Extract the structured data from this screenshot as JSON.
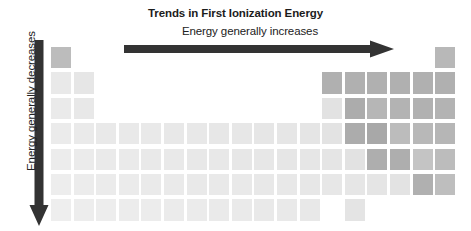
{
  "figure": {
    "title": "Trends in First Ionization Energy",
    "horizontal_label": "Energy generally increases",
    "vertical_label": "Energy generally decreases",
    "arrow_color": "#333333",
    "title_color": "#1c1c1c"
  },
  "chart_data": {
    "type": "heatmap",
    "title": "Trends in First Ionization Energy",
    "xlabel": "Energy generally increases",
    "ylabel": "Energy generally decreases",
    "subtitle": "",
    "grid": false,
    "legend": "none",
    "columns": 18,
    "rows": 7,
    "col_pitch_px": 22.6,
    "row_pitch_px": 25.4,
    "value_range": [
      0,
      1
    ],
    "color_low": "#e8e8e8",
    "color_high": "#9a9a9a",
    "cells": [
      {
        "row": 1,
        "col": 1,
        "value": 0.62,
        "color": "#bcbcbc"
      },
      {
        "row": 1,
        "col": 18,
        "value": 0.6,
        "color": "#b8b8b8"
      },
      {
        "row": 2,
        "col": 1,
        "value": 0.06,
        "color": "#e9e9e9"
      },
      {
        "row": 2,
        "col": 2,
        "value": 0.1,
        "color": "#e6e6e6"
      },
      {
        "row": 2,
        "col": 13,
        "value": 0.58,
        "color": "#b0b0b0"
      },
      {
        "row": 2,
        "col": 14,
        "value": 0.58,
        "color": "#b0b0b0"
      },
      {
        "row": 2,
        "col": 15,
        "value": 0.58,
        "color": "#b0b0b0"
      },
      {
        "row": 2,
        "col": 16,
        "value": 0.58,
        "color": "#b0b0b0"
      },
      {
        "row": 2,
        "col": 17,
        "value": 0.58,
        "color": "#b0b0b0"
      },
      {
        "row": 2,
        "col": 18,
        "value": 0.58,
        "color": "#b0b0b0"
      },
      {
        "row": 3,
        "col": 1,
        "value": 0.05,
        "color": "#eaeaea"
      },
      {
        "row": 3,
        "col": 2,
        "value": 0.08,
        "color": "#e8e8e8"
      },
      {
        "row": 3,
        "col": 13,
        "value": 0.14,
        "color": "#e2e2e2"
      },
      {
        "row": 3,
        "col": 14,
        "value": 0.62,
        "color": "#acacac"
      },
      {
        "row": 3,
        "col": 15,
        "value": 0.52,
        "color": "#b6b6b6"
      },
      {
        "row": 3,
        "col": 16,
        "value": 0.55,
        "color": "#b3b3b3"
      },
      {
        "row": 3,
        "col": 17,
        "value": 0.57,
        "color": "#b1b1b1"
      },
      {
        "row": 3,
        "col": 18,
        "value": 0.55,
        "color": "#b3b3b3"
      },
      {
        "row": 4,
        "col": 1,
        "value": 0.04,
        "color": "#ebebeb"
      },
      {
        "row": 4,
        "col": 2,
        "value": 0.05,
        "color": "#eaeaea"
      },
      {
        "row": 4,
        "col": 3,
        "value": 0.06,
        "color": "#e9e9e9"
      },
      {
        "row": 4,
        "col": 4,
        "value": 0.06,
        "color": "#e9e9e9"
      },
      {
        "row": 4,
        "col": 5,
        "value": 0.06,
        "color": "#e9e9e9"
      },
      {
        "row": 4,
        "col": 6,
        "value": 0.07,
        "color": "#e8e8e8"
      },
      {
        "row": 4,
        "col": 7,
        "value": 0.07,
        "color": "#e8e8e8"
      },
      {
        "row": 4,
        "col": 8,
        "value": 0.08,
        "color": "#e7e7e7"
      },
      {
        "row": 4,
        "col": 9,
        "value": 0.08,
        "color": "#e7e7e7"
      },
      {
        "row": 4,
        "col": 10,
        "value": 0.09,
        "color": "#e6e6e6"
      },
      {
        "row": 4,
        "col": 11,
        "value": 0.09,
        "color": "#e6e6e6"
      },
      {
        "row": 4,
        "col": 12,
        "value": 0.1,
        "color": "#e5e5e5"
      },
      {
        "row": 4,
        "col": 13,
        "value": 0.12,
        "color": "#e3e3e3"
      },
      {
        "row": 4,
        "col": 14,
        "value": 0.62,
        "color": "#acacac"
      },
      {
        "row": 4,
        "col": 15,
        "value": 0.64,
        "color": "#a8a8a8"
      },
      {
        "row": 4,
        "col": 16,
        "value": 0.46,
        "color": "#bcbcbc"
      },
      {
        "row": 4,
        "col": 17,
        "value": 0.5,
        "color": "#b8b8b8"
      },
      {
        "row": 4,
        "col": 18,
        "value": 0.52,
        "color": "#b6b6b6"
      },
      {
        "row": 5,
        "col": 1,
        "value": 0.03,
        "color": "#ececec"
      },
      {
        "row": 5,
        "col": 2,
        "value": 0.04,
        "color": "#ebebeb"
      },
      {
        "row": 5,
        "col": 3,
        "value": 0.05,
        "color": "#eaeaea"
      },
      {
        "row": 5,
        "col": 4,
        "value": 0.05,
        "color": "#eaeaea"
      },
      {
        "row": 5,
        "col": 5,
        "value": 0.06,
        "color": "#e9e9e9"
      },
      {
        "row": 5,
        "col": 6,
        "value": 0.06,
        "color": "#e9e9e9"
      },
      {
        "row": 5,
        "col": 7,
        "value": 0.07,
        "color": "#e8e8e8"
      },
      {
        "row": 5,
        "col": 8,
        "value": 0.07,
        "color": "#e8e8e8"
      },
      {
        "row": 5,
        "col": 9,
        "value": 0.08,
        "color": "#e7e7e7"
      },
      {
        "row": 5,
        "col": 10,
        "value": 0.08,
        "color": "#e7e7e7"
      },
      {
        "row": 5,
        "col": 11,
        "value": 0.09,
        "color": "#e6e6e6"
      },
      {
        "row": 5,
        "col": 12,
        "value": 0.09,
        "color": "#e6e6e6"
      },
      {
        "row": 5,
        "col": 13,
        "value": 0.1,
        "color": "#e5e5e5"
      },
      {
        "row": 5,
        "col": 14,
        "value": 0.13,
        "color": "#e2e2e2"
      },
      {
        "row": 5,
        "col": 15,
        "value": 0.6,
        "color": "#aeaeae"
      },
      {
        "row": 5,
        "col": 16,
        "value": 0.6,
        "color": "#aeaeae"
      },
      {
        "row": 5,
        "col": 17,
        "value": 0.38,
        "color": "#c4c4c4"
      },
      {
        "row": 5,
        "col": 18,
        "value": 0.46,
        "color": "#bcbcbc"
      },
      {
        "row": 6,
        "col": 1,
        "value": 0.03,
        "color": "#ededed"
      },
      {
        "row": 6,
        "col": 2,
        "value": 0.03,
        "color": "#ececec"
      },
      {
        "row": 6,
        "col": 3,
        "value": 0.04,
        "color": "#ebebeb"
      },
      {
        "row": 6,
        "col": 4,
        "value": 0.04,
        "color": "#ebebeb"
      },
      {
        "row": 6,
        "col": 5,
        "value": 0.05,
        "color": "#eaeaea"
      },
      {
        "row": 6,
        "col": 6,
        "value": 0.05,
        "color": "#eaeaea"
      },
      {
        "row": 6,
        "col": 7,
        "value": 0.06,
        "color": "#e9e9e9"
      },
      {
        "row": 6,
        "col": 8,
        "value": 0.06,
        "color": "#e9e9e9"
      },
      {
        "row": 6,
        "col": 9,
        "value": 0.06,
        "color": "#e9e9e9"
      },
      {
        "row": 6,
        "col": 10,
        "value": 0.07,
        "color": "#e8e8e8"
      },
      {
        "row": 6,
        "col": 11,
        "value": 0.07,
        "color": "#e8e8e8"
      },
      {
        "row": 6,
        "col": 12,
        "value": 0.08,
        "color": "#e7e7e7"
      },
      {
        "row": 6,
        "col": 13,
        "value": 0.08,
        "color": "#e7e7e7"
      },
      {
        "row": 6,
        "col": 14,
        "value": 0.09,
        "color": "#e6e6e6"
      },
      {
        "row": 6,
        "col": 15,
        "value": 0.1,
        "color": "#e5e5e5"
      },
      {
        "row": 6,
        "col": 16,
        "value": 0.12,
        "color": "#e3e3e3"
      },
      {
        "row": 6,
        "col": 17,
        "value": 0.58,
        "color": "#b0b0b0"
      },
      {
        "row": 6,
        "col": 18,
        "value": 0.44,
        "color": "#bebebe"
      },
      {
        "row": 7,
        "col": 1,
        "value": 0.02,
        "color": "#eeeeee"
      },
      {
        "row": 7,
        "col": 2,
        "value": 0.03,
        "color": "#ededed"
      },
      {
        "row": 7,
        "col": 3,
        "value": 0.03,
        "color": "#ededed"
      },
      {
        "row": 7,
        "col": 4,
        "value": 0.04,
        "color": "#ececec"
      },
      {
        "row": 7,
        "col": 5,
        "value": 0.04,
        "color": "#ececec"
      },
      {
        "row": 7,
        "col": 6,
        "value": 0.04,
        "color": "#ebebeb"
      },
      {
        "row": 7,
        "col": 7,
        "value": 0.05,
        "color": "#ebebeb"
      },
      {
        "row": 7,
        "col": 8,
        "value": 0.05,
        "color": "#eaeaea"
      },
      {
        "row": 7,
        "col": 9,
        "value": 0.05,
        "color": "#eaeaea"
      },
      {
        "row": 7,
        "col": 10,
        "value": 0.06,
        "color": "#e9e9e9"
      },
      {
        "row": 7,
        "col": 11,
        "value": 0.06,
        "color": "#e9e9e9"
      },
      {
        "row": 7,
        "col": 12,
        "value": 0.07,
        "color": "#e8e8e8"
      },
      {
        "row": 7,
        "col": 14,
        "value": 0.11,
        "color": "#e4e4e4"
      }
    ]
  }
}
